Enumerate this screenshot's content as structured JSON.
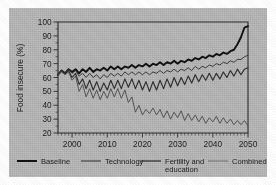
{
  "chart_data": {
    "type": "line",
    "title": "",
    "xlabel": "",
    "ylabel": "Food insecure (%)",
    "xlim": [
      1996,
      2050
    ],
    "ylim": [
      20,
      100
    ],
    "grid": false,
    "legend_position": "bottom",
    "xticks": [
      "2000",
      "2010",
      "2020",
      "2030",
      "2040",
      "2050"
    ],
    "xtick_values": [
      2000,
      2010,
      2020,
      2030,
      2040,
      2050
    ],
    "yticks": [
      "20",
      "30",
      "40",
      "50",
      "60",
      "70",
      "80",
      "90",
      "100"
    ],
    "ytick_values": [
      20,
      30,
      40,
      50,
      60,
      70,
      80,
      90,
      100
    ],
    "x": [
      1996,
      1997,
      1998,
      1999,
      2000,
      2001,
      2002,
      2003,
      2004,
      2005,
      2006,
      2007,
      2008,
      2009,
      2010,
      2011,
      2012,
      2013,
      2014,
      2015,
      2016,
      2017,
      2018,
      2019,
      2020,
      2021,
      2022,
      2023,
      2024,
      2025,
      2026,
      2027,
      2028,
      2029,
      2030,
      2031,
      2032,
      2033,
      2034,
      2035,
      2036,
      2037,
      2038,
      2039,
      2040,
      2041,
      2042,
      2043,
      2044,
      2045,
      2046,
      2047,
      2048,
      2049,
      2050
    ],
    "series": [
      {
        "name": "Baseline",
        "style": "thick-black",
        "values": [
          62,
          65,
          63,
          66,
          64,
          66,
          63,
          66,
          64,
          67,
          64,
          66,
          65,
          67,
          65,
          68,
          66,
          68,
          66,
          68,
          67,
          69,
          67,
          69,
          68,
          70,
          68,
          70,
          69,
          71,
          69,
          71,
          70,
          72,
          70,
          72,
          71,
          73,
          72,
          74,
          73,
          75,
          74,
          76,
          75,
          77,
          76,
          78,
          77,
          79,
          80,
          84,
          89,
          96,
          97
        ]
      },
      {
        "name": "Technology",
        "style": "medium",
        "values": [
          62,
          65,
          63,
          66,
          63,
          65,
          61,
          63,
          60,
          63,
          60,
          62,
          59,
          62,
          60,
          63,
          61,
          63,
          61,
          64,
          62,
          64,
          62,
          64,
          62,
          64,
          62,
          64,
          63,
          65,
          63,
          65,
          64,
          66,
          64,
          66,
          65,
          67,
          65,
          68,
          66,
          68,
          67,
          69,
          68,
          70,
          69,
          71,
          70,
          72,
          71,
          73,
          73,
          75,
          76
        ]
      },
      {
        "name": "Fertility and education",
        "style": "medium",
        "values": [
          62,
          65,
          63,
          65,
          60,
          63,
          55,
          59,
          52,
          58,
          51,
          57,
          50,
          56,
          51,
          58,
          52,
          58,
          52,
          59,
          53,
          59,
          52,
          58,
          51,
          57,
          50,
          57,
          51,
          58,
          52,
          59,
          53,
          60,
          54,
          60,
          55,
          61,
          56,
          62,
          57,
          62,
          58,
          63,
          58,
          63,
          59,
          64,
          60,
          65,
          61,
          66,
          62,
          66,
          67
        ]
      },
      {
        "name": "Combined",
        "style": "thin",
        "values": [
          62,
          64,
          62,
          64,
          58,
          61,
          50,
          55,
          46,
          52,
          45,
          51,
          44,
          50,
          45,
          52,
          46,
          52,
          45,
          51,
          42,
          46,
          35,
          40,
          33,
          37,
          34,
          38,
          33,
          37,
          31,
          36,
          30,
          35,
          31,
          36,
          29,
          34,
          29,
          33,
          28,
          32,
          27,
          31,
          28,
          32,
          27,
          31,
          27,
          30,
          26,
          29,
          26,
          29,
          25
        ]
      }
    ]
  },
  "axes": {
    "ylabel": "Food insecure (%)"
  },
  "legend": {
    "items": [
      {
        "label": "Baseline",
        "style": "thick-black"
      },
      {
        "label": "Technology",
        "style": "medium"
      },
      {
        "label": "Fertility and",
        "label2": "education",
        "style": "medium"
      },
      {
        "label": "Combined",
        "style": "thin"
      }
    ]
  }
}
